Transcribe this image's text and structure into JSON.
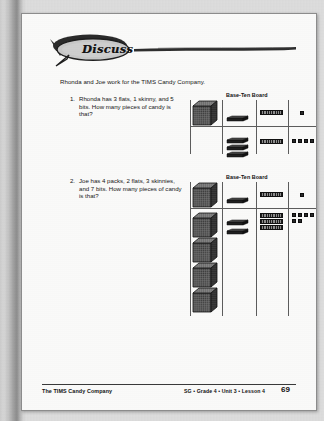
{
  "banner": {
    "label": "Discuss",
    "icon": "speech-bubble-icon"
  },
  "intro": "Rhonda and Joe work for the TIMS Candy Company.",
  "problems": [
    {
      "number": "1.",
      "text": "Rhonda has 3 flats, 1 skinny, and 5 bits. How many pieces of candy is that?"
    },
    {
      "number": "2.",
      "text": "Joe has 4 packs, 2 flats, 3 skinnies, and 7 bits. How many pieces of candy is that?"
    }
  ],
  "boards": [
    {
      "title": "Base-Ten Board",
      "columns": [
        "packs",
        "flats",
        "skinnies",
        "bits"
      ],
      "header_row": {
        "packs": 1,
        "flats": 1,
        "skinnies": 1,
        "bits": 1
      },
      "answer_row": {
        "packs": 0,
        "flats": 3,
        "skinnies": 1,
        "bits": 5
      }
    },
    {
      "title": "Base-Ten Board",
      "columns": [
        "packs",
        "flats",
        "skinnies",
        "bits"
      ],
      "header_row": {
        "packs": 1,
        "flats": 1,
        "skinnies": 1,
        "bits": 1
      },
      "answer_row": {
        "packs": 4,
        "flats": 2,
        "skinnies": 3,
        "bits": 7
      }
    }
  ],
  "footer": {
    "left": "The TIMS Candy Company",
    "center": "SG • Grade 4 • Unit 3 • Lesson 4",
    "page": "69"
  },
  "colors": {
    "ink": "#161616",
    "rule": "#5d5d5d",
    "paper": "#fcfcfb",
    "scan_border": "#b9b9b9"
  }
}
